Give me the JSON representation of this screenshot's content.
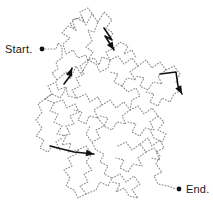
{
  "figure": {
    "kind": "maze-puzzle",
    "width": 213,
    "height": 211,
    "background_color": "#ffffff"
  },
  "labels": {
    "start": "Start.",
    "end": "End."
  },
  "markers": {
    "start_dot": {
      "x": 42,
      "y": 49,
      "r": 2.4,
      "color": "#111111"
    },
    "end_dot": {
      "x": 179,
      "y": 189,
      "r": 2.4,
      "color": "#111111"
    }
  },
  "style": {
    "path_color": "#8d8d8d",
    "path_width": 1.1,
    "path_dash": "0.9 2.1",
    "arrow_color": "#111111",
    "arrow_width": 1.6,
    "text_color": "#1a1a1a"
  },
  "paths": [
    {
      "name": "start-stub",
      "points": [
        [
          45,
          49
        ],
        [
          56,
          49
        ],
        [
          58,
          43
        ],
        [
          62,
          47
        ],
        [
          62,
          58
        ],
        [
          56,
          62
        ],
        [
          58,
          69
        ],
        [
          52,
          73
        ],
        [
          57,
          80
        ]
      ]
    },
    {
      "name": "upper-left-loop",
      "points": [
        [
          57,
          80
        ],
        [
          66,
          72
        ],
        [
          70,
          79
        ],
        [
          76,
          66
        ],
        [
          81,
          74
        ],
        [
          88,
          62
        ],
        [
          86,
          55
        ],
        [
          78,
          58
        ],
        [
          73,
          50
        ],
        [
          66,
          54
        ],
        [
          63,
          44
        ],
        [
          70,
          38
        ],
        [
          62,
          33
        ],
        [
          68,
          26
        ],
        [
          76,
          30
        ],
        [
          72,
          20
        ],
        [
          82,
          17
        ],
        [
          86,
          25
        ],
        [
          92,
          14
        ],
        [
          98,
          22
        ],
        [
          94,
          32
        ],
        [
          88,
          30
        ],
        [
          92,
          41
        ],
        [
          86,
          47
        ],
        [
          93,
          52
        ],
        [
          88,
          60
        ]
      ]
    },
    {
      "name": "upper-right-ridge",
      "points": [
        [
          98,
          22
        ],
        [
          104,
          12
        ],
        [
          112,
          20
        ],
        [
          106,
          28
        ],
        [
          113,
          33
        ],
        [
          108,
          41
        ],
        [
          114,
          48
        ],
        [
          106,
          52
        ],
        [
          110,
          60
        ],
        [
          102,
          57
        ],
        [
          99,
          65
        ],
        [
          94,
          58
        ],
        [
          88,
          60
        ]
      ]
    },
    {
      "name": "mid-upper-zigzag",
      "points": [
        [
          88,
          60
        ],
        [
          80,
          66
        ],
        [
          84,
          74
        ],
        [
          76,
          78
        ],
        [
          80,
          86
        ],
        [
          72,
          90
        ],
        [
          77,
          98
        ],
        [
          68,
          96
        ],
        [
          66,
          87
        ],
        [
          58,
          90
        ],
        [
          56,
          82
        ],
        [
          48,
          86
        ],
        [
          52,
          94
        ],
        [
          45,
          99
        ]
      ]
    },
    {
      "name": "mid-left-web",
      "points": [
        [
          45,
          99
        ],
        [
          54,
          103
        ],
        [
          50,
          111
        ],
        [
          58,
          114
        ],
        [
          54,
          122
        ],
        [
          62,
          126
        ],
        [
          57,
          134
        ],
        [
          66,
          136
        ],
        [
          62,
          145
        ],
        [
          71,
          143
        ],
        [
          68,
          152
        ],
        [
          78,
          150
        ]
      ]
    },
    {
      "name": "mid-left-inner",
      "points": [
        [
          54,
          103
        ],
        [
          63,
          100
        ],
        [
          67,
          108
        ],
        [
          75,
          104
        ],
        [
          79,
          112
        ],
        [
          70,
          116
        ],
        [
          74,
          124
        ],
        [
          66,
          126
        ],
        [
          70,
          134
        ],
        [
          62,
          136
        ]
      ]
    },
    {
      "name": "mid-center-web",
      "points": [
        [
          77,
          98
        ],
        [
          86,
          94
        ],
        [
          90,
          102
        ],
        [
          98,
          97
        ],
        [
          102,
          105
        ],
        [
          94,
          110
        ],
        [
          98,
          118
        ],
        [
          89,
          116
        ],
        [
          86,
          124
        ],
        [
          78,
          120
        ],
        [
          82,
          112
        ],
        [
          74,
          110
        ]
      ]
    },
    {
      "name": "center-ring",
      "points": [
        [
          102,
          105
        ],
        [
          110,
          100
        ],
        [
          116,
          108
        ],
        [
          124,
          102
        ],
        [
          130,
          110
        ],
        [
          122,
          116
        ],
        [
          126,
          124
        ],
        [
          117,
          122
        ],
        [
          112,
          130
        ],
        [
          104,
          126
        ],
        [
          108,
          118
        ],
        [
          100,
          116
        ]
      ]
    },
    {
      "name": "mid-right-web",
      "points": [
        [
          110,
          60
        ],
        [
          118,
          56
        ],
        [
          124,
          64
        ],
        [
          132,
          58
        ],
        [
          138,
          66
        ],
        [
          130,
          72
        ],
        [
          136,
          80
        ],
        [
          127,
          78
        ],
        [
          122,
          86
        ],
        [
          114,
          82
        ],
        [
          118,
          74
        ],
        [
          110,
          72
        ]
      ]
    },
    {
      "name": "right-upper-block",
      "points": [
        [
          138,
          66
        ],
        [
          146,
          60
        ],
        [
          152,
          68
        ],
        [
          160,
          62
        ],
        [
          166,
          70
        ],
        [
          158,
          76
        ],
        [
          162,
          84
        ],
        [
          153,
          82
        ],
        [
          148,
          90
        ],
        [
          140,
          86
        ],
        [
          144,
          78
        ],
        [
          136,
          76
        ]
      ]
    },
    {
      "name": "right-edge-run",
      "points": [
        [
          166,
          70
        ],
        [
          174,
          66
        ],
        [
          180,
          74
        ],
        [
          176,
          82
        ],
        [
          182,
          90
        ],
        [
          174,
          94
        ],
        [
          170,
          102
        ],
        [
          162,
          98
        ],
        [
          158,
          106
        ],
        [
          150,
          102
        ],
        [
          154,
          94
        ],
        [
          146,
          92
        ]
      ]
    },
    {
      "name": "mid-right-lower",
      "points": [
        [
          130,
          110
        ],
        [
          138,
          106
        ],
        [
          144,
          114
        ],
        [
          152,
          108
        ],
        [
          158,
          116
        ],
        [
          150,
          122
        ],
        [
          154,
          130
        ],
        [
          145,
          128
        ],
        [
          140,
          136
        ],
        [
          132,
          132
        ],
        [
          136,
          124
        ],
        [
          128,
          122
        ]
      ]
    },
    {
      "name": "lower-connector",
      "points": [
        [
          78,
          150
        ],
        [
          86,
          146
        ],
        [
          92,
          154
        ],
        [
          86,
          162
        ],
        [
          92,
          170
        ],
        [
          84,
          174
        ],
        [
          88,
          182
        ],
        [
          80,
          186
        ],
        [
          86,
          194
        ],
        [
          96,
          190
        ],
        [
          100,
          182
        ],
        [
          108,
          186
        ],
        [
          112,
          178
        ],
        [
          104,
          174
        ],
        [
          108,
          166
        ],
        [
          100,
          162
        ],
        [
          104,
          154
        ],
        [
          96,
          150
        ],
        [
          92,
          142
        ]
      ]
    },
    {
      "name": "lower-center-web",
      "points": [
        [
          112,
          178
        ],
        [
          120,
          174
        ],
        [
          126,
          182
        ],
        [
          134,
          176
        ],
        [
          140,
          184
        ],
        [
          132,
          190
        ],
        [
          138,
          198
        ],
        [
          129,
          196
        ],
        [
          124,
          188
        ],
        [
          116,
          192
        ],
        [
          120,
          184
        ],
        [
          112,
          182
        ]
      ]
    },
    {
      "name": "lower-right-web",
      "points": [
        [
          118,
          146
        ],
        [
          126,
          142
        ],
        [
          132,
          150
        ],
        [
          140,
          144
        ],
        [
          146,
          152
        ],
        [
          138,
          158
        ],
        [
          142,
          166
        ],
        [
          133,
          164
        ],
        [
          128,
          172
        ],
        [
          120,
          168
        ],
        [
          124,
          160
        ],
        [
          116,
          158
        ]
      ]
    },
    {
      "name": "lower-right-block",
      "points": [
        [
          146,
          152
        ],
        [
          154,
          148
        ],
        [
          160,
          156
        ],
        [
          156,
          164
        ],
        [
          162,
          172
        ],
        [
          154,
          176
        ],
        [
          158,
          184
        ],
        [
          168,
          186
        ],
        [
          176,
          189
        ]
      ]
    },
    {
      "name": "lower-right-inner",
      "points": [
        [
          140,
          144
        ],
        [
          148,
          138
        ],
        [
          152,
          146
        ],
        [
          160,
          140
        ],
        [
          164,
          148
        ],
        [
          156,
          152
        ],
        [
          160,
          160
        ],
        [
          151,
          158
        ]
      ]
    },
    {
      "name": "lower-left-tail",
      "points": [
        [
          86,
          194
        ],
        [
          78,
          198
        ],
        [
          74,
          190
        ],
        [
          66,
          186
        ],
        [
          70,
          178
        ],
        [
          64,
          170
        ],
        [
          72,
          166
        ],
        [
          68,
          158
        ],
        [
          76,
          154
        ],
        [
          78,
          150
        ]
      ]
    },
    {
      "name": "far-left-lower",
      "points": [
        [
          45,
          99
        ],
        [
          38,
          104
        ],
        [
          42,
          112
        ],
        [
          36,
          120
        ],
        [
          42,
          128
        ],
        [
          36,
          136
        ],
        [
          44,
          140
        ],
        [
          40,
          148
        ],
        [
          48,
          152
        ],
        [
          52,
          146
        ],
        [
          60,
          150
        ],
        [
          56,
          142
        ],
        [
          62,
          138
        ]
      ]
    },
    {
      "name": "upper-small-hook",
      "points": [
        [
          76,
          30
        ],
        [
          70,
          24
        ],
        [
          76,
          18
        ],
        [
          84,
          22
        ],
        [
          80,
          12
        ],
        [
          88,
          8
        ],
        [
          94,
          16
        ]
      ]
    },
    {
      "name": "center-small-hook",
      "points": [
        [
          114,
          48
        ],
        [
          120,
          42
        ],
        [
          128,
          46
        ],
        [
          124,
          54
        ],
        [
          132,
          50
        ],
        [
          136,
          58
        ]
      ]
    },
    {
      "name": "center-lower-hook",
      "points": [
        [
          98,
          118
        ],
        [
          104,
          126
        ],
        [
          96,
          130
        ],
        [
          100,
          138
        ],
        [
          92,
          142
        ],
        [
          86,
          134
        ],
        [
          90,
          126
        ]
      ]
    },
    {
      "name": "right-lower-hook",
      "points": [
        [
          158,
          116
        ],
        [
          164,
          122
        ],
        [
          158,
          130
        ],
        [
          166,
          134
        ],
        [
          162,
          142
        ],
        [
          154,
          138
        ],
        [
          150,
          130
        ]
      ]
    },
    {
      "name": "mid-bridge-a",
      "points": [
        [
          88,
          60
        ],
        [
          96,
          64
        ],
        [
          100,
          72
        ],
        [
          108,
          68
        ],
        [
          110,
          60
        ]
      ]
    },
    {
      "name": "mid-bridge-b",
      "points": [
        [
          45,
          99
        ],
        [
          52,
          94
        ],
        [
          60,
          98
        ],
        [
          64,
          92
        ],
        [
          66,
          87
        ]
      ]
    },
    {
      "name": "mid-bridge-c",
      "points": [
        [
          122,
          86
        ],
        [
          128,
          92
        ],
        [
          136,
          88
        ],
        [
          140,
          96
        ],
        [
          132,
          100
        ],
        [
          130,
          110
        ]
      ]
    }
  ],
  "arrows": [
    {
      "name": "arrow-upper-right",
      "points": [
        [
          104,
          28
        ],
        [
          112,
          40
        ],
        [
          105,
          36
        ],
        [
          114,
          50
        ]
      ],
      "tip": [
        114,
        50
      ],
      "angle_deg": 58
    },
    {
      "name": "arrow-mid-left",
      "points": [
        [
          64,
          84
        ],
        [
          70,
          76
        ],
        [
          72,
          68
        ]
      ],
      "tip": [
        72,
        68
      ],
      "angle_deg": -68
    },
    {
      "name": "arrow-right",
      "points": [
        [
          160,
          74
        ],
        [
          176,
          72
        ],
        [
          178,
          86
        ],
        [
          182,
          94
        ]
      ],
      "tip": [
        182,
        94
      ],
      "angle_deg": 62
    },
    {
      "name": "arrow-lower-left",
      "points": [
        [
          50,
          146
        ],
        [
          74,
          152
        ],
        [
          94,
          154
        ]
      ],
      "tip": [
        94,
        154
      ],
      "angle_deg": 8
    }
  ]
}
